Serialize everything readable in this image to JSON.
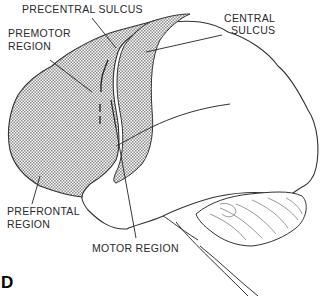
{
  "figure": {
    "panel_letter": "D",
    "labels": {
      "precentral_sulcus": "PRECENTRAL  SULCUS",
      "central_sulcus_line1": "CENTRAL",
      "central_sulcus_line2": "SULCUS",
      "premotor_line1": "PREMOTOR",
      "premotor_line2": "REGION",
      "prefrontal_line1": "PREFRONTAL",
      "prefrontal_line2": "REGION",
      "motor_region": "MOTOR REGION"
    },
    "colors": {
      "stroke": "#333333",
      "stipple": "#9a9a9a",
      "background": "#ffffff"
    }
  }
}
